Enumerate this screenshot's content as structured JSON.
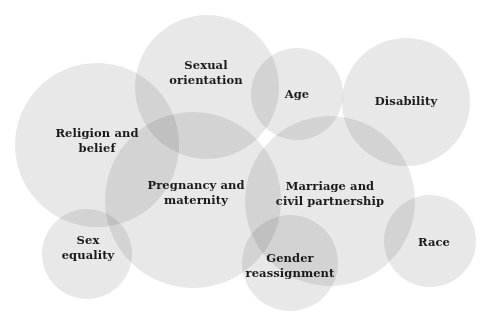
{
  "figure": {
    "background_color": "#ffffff",
    "circle_fill": "#e8e8e8",
    "circle_overlap_color": "#c4c4c4",
    "label_color": "#1a1a1a",
    "clipped_caption": ""
  },
  "chart_data": {
    "type": "venn",
    "xlabel": "",
    "ylabel": "",
    "legend_position": "none",
    "grid": false,
    "fill_color": "#e8e8e8",
    "sets": [
      {
        "id": "religion-and-belief",
        "label": "Religion and\nbelief",
        "cx": 97,
        "cy": 145,
        "r": 82,
        "label_x": 97,
        "label_y": 141
      },
      {
        "id": "sexual-orientation",
        "label": "Sexual\norientation",
        "cx": 207,
        "cy": 87,
        "r": 72,
        "label_x": 206,
        "label_y": 73
      },
      {
        "id": "age",
        "label": "Age",
        "cx": 297,
        "cy": 94,
        "r": 46,
        "label_x": 297,
        "label_y": 94
      },
      {
        "id": "disability",
        "label": "Disability",
        "cx": 406,
        "cy": 102,
        "r": 64,
        "label_x": 406,
        "label_y": 101
      },
      {
        "id": "pregnancy-and-maternity",
        "label": "Pregnancy and\nmaternity",
        "cx": 193,
        "cy": 200,
        "r": 88,
        "label_x": 196,
        "label_y": 193
      },
      {
        "id": "marriage-and-civil-partnership",
        "label": "Marriage and\ncivil partnership",
        "cx": 330,
        "cy": 201,
        "r": 85,
        "label_x": 330,
        "label_y": 194
      },
      {
        "id": "sex-equality",
        "label": "Sex\nequality",
        "cx": 87,
        "cy": 254,
        "r": 45,
        "label_x": 88,
        "label_y": 248
      },
      {
        "id": "gender-reassignment",
        "label": "Gender\nreassignment",
        "cx": 290,
        "cy": 263,
        "r": 48,
        "label_x": 290,
        "label_y": 266
      },
      {
        "id": "race",
        "label": "Race",
        "cx": 430,
        "cy": 241,
        "r": 46,
        "label_x": 434,
        "label_y": 242
      }
    ]
  }
}
